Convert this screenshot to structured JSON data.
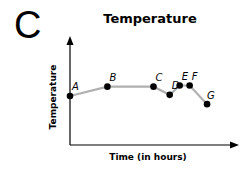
{
  "panel_letter": "C",
  "chart_data": {
    "type": "line",
    "title": "Temperature",
    "xlabel": "Time (in hours)",
    "ylabel": "Temperature",
    "grid": false,
    "ticks": false,
    "legend": null,
    "line_color": "#b0b0b0",
    "marker_color": "#000000",
    "points": [
      {
        "label": "A",
        "x": 0,
        "y": 4.2
      },
      {
        "label": "B",
        "x": 3,
        "y": 5.0
      },
      {
        "label": "C",
        "x": 6.7,
        "y": 5.0
      },
      {
        "label": "D",
        "x": 8,
        "y": 4.3
      },
      {
        "label": "E",
        "x": 8.8,
        "y": 5.1
      },
      {
        "label": "F",
        "x": 9.6,
        "y": 5.1
      },
      {
        "label": "G",
        "x": 11,
        "y": 3.5
      }
    ],
    "xlim": [
      0,
      13
    ],
    "ylim": [
      0,
      9
    ]
  }
}
